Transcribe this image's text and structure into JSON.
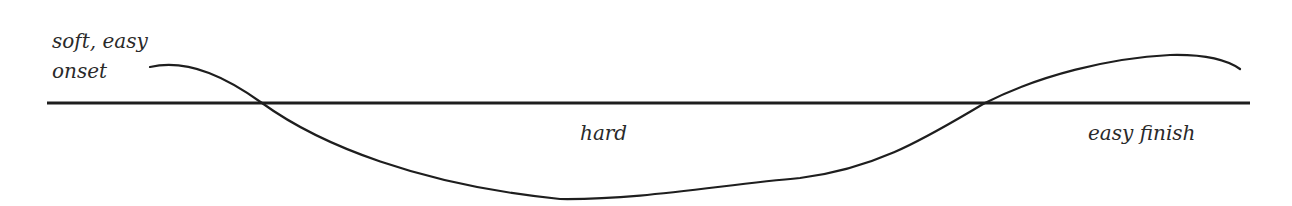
{
  "diagram": {
    "type": "intonation-contour",
    "labels": {
      "onset": "soft, easy onset",
      "middle": "hard",
      "finish": "easy finish"
    },
    "colors": {
      "line": "#1e1e1e",
      "text": "#2a2a2a",
      "background": "#ffffff"
    }
  }
}
